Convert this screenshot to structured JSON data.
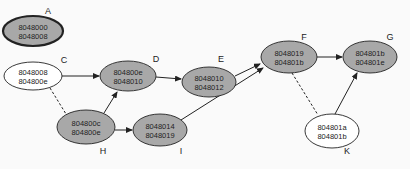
{
  "colors": {
    "gray_fill": "#a8a8a8",
    "white_fill": "#ffffff",
    "stroke": "#333333",
    "background": "#fafafa"
  },
  "nodes": [
    {
      "id": "A",
      "label": "A",
      "line1": "8048000",
      "line2": "8048008",
      "fill": "gray",
      "cx": 33,
      "cy": 31,
      "rx": 30,
      "ry": 15,
      "lx": 48,
      "ly": 14,
      "thick": true
    },
    {
      "id": "C",
      "label": "C",
      "line1": "8048008",
      "line2": "804800e",
      "fill": "white",
      "cx": 33,
      "cy": 76,
      "rx": 29,
      "ry": 14,
      "lx": 64,
      "ly": 63,
      "thick": false
    },
    {
      "id": "D",
      "label": "D",
      "line1": "804800e",
      "line2": "8048010",
      "fill": "gray",
      "cx": 128,
      "cy": 76,
      "rx": 28,
      "ry": 15,
      "lx": 156,
      "ly": 62,
      "thick": false
    },
    {
      "id": "E",
      "label": "E",
      "line1": "8048010",
      "line2": "8048012",
      "fill": "gray",
      "cx": 209,
      "cy": 82,
      "rx": 27,
      "ry": 15,
      "lx": 221,
      "ly": 62,
      "thick": false
    },
    {
      "id": "F",
      "label": "F",
      "line1": "8048019",
      "line2": "804801b",
      "fill": "gray",
      "cx": 289,
      "cy": 57,
      "rx": 28,
      "ry": 16,
      "lx": 304,
      "ly": 40,
      "thick": false
    },
    {
      "id": "G",
      "label": "G",
      "line1": "804801b",
      "line2": "804801e",
      "fill": "gray",
      "cx": 370,
      "cy": 57,
      "rx": 27,
      "ry": 16,
      "lx": 390,
      "ly": 40,
      "thick": false
    },
    {
      "id": "H",
      "label": "H",
      "line1": "804800c",
      "line2": "804800e",
      "fill": "gray",
      "cx": 86,
      "cy": 127,
      "rx": 29,
      "ry": 17,
      "lx": 103,
      "ly": 154,
      "thick": false
    },
    {
      "id": "I",
      "label": "I",
      "line1": "8048014",
      "line2": "8048019",
      "fill": "gray",
      "cx": 160,
      "cy": 130,
      "rx": 27,
      "ry": 16,
      "lx": 181,
      "ly": 154,
      "thick": false
    },
    {
      "id": "K",
      "label": "K",
      "line1": "804801a",
      "line2": "804801b",
      "fill": "white",
      "cx": 332,
      "cy": 131,
      "rx": 27,
      "ry": 17,
      "lx": 347,
      "ly": 154,
      "thick": false
    }
  ],
  "edges": [
    {
      "from": "C",
      "to": "D",
      "x1": 62,
      "y1": 76,
      "x2": 99,
      "y2": 76,
      "dashed": false,
      "arrow": true
    },
    {
      "from": "H",
      "to": "D",
      "x1": 104,
      "y1": 113,
      "x2": 117,
      "y2": 92,
      "dashed": false,
      "arrow": true
    },
    {
      "from": "D",
      "to": "E",
      "x1": 156,
      "y1": 77,
      "x2": 181,
      "y2": 79,
      "dashed": false,
      "arrow": true
    },
    {
      "from": "E",
      "to": "F",
      "x1": 235,
      "y1": 76,
      "x2": 260,
      "y2": 64,
      "dashed": false,
      "arrow": true
    },
    {
      "from": "I",
      "to": "F",
      "x1": 181,
      "y1": 120,
      "x2": 263,
      "y2": 68,
      "dashed": false,
      "arrow": true
    },
    {
      "from": "H",
      "to": "I",
      "x1": 115,
      "y1": 130,
      "x2": 132,
      "y2": 130,
      "dashed": false,
      "arrow": true
    },
    {
      "from": "F",
      "to": "G",
      "x1": 317,
      "y1": 57,
      "x2": 342,
      "y2": 57,
      "dashed": false,
      "arrow": true
    },
    {
      "from": "K",
      "to": "G",
      "x1": 335,
      "y1": 114,
      "x2": 357,
      "y2": 73,
      "dashed": false,
      "arrow": true
    },
    {
      "from": "C",
      "to": "H",
      "x1": 50,
      "y1": 88,
      "x2": 66,
      "y2": 114,
      "dashed": true,
      "arrow": false
    },
    {
      "from": "F",
      "to": "K",
      "x1": 292,
      "y1": 73,
      "x2": 318,
      "y2": 115,
      "dashed": true,
      "arrow": false
    }
  ]
}
